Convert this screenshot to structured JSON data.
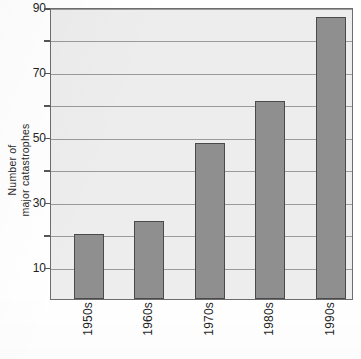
{
  "chart_data": {
    "type": "bar",
    "title": "",
    "xlabel": "",
    "ylabel_line1": "Number of",
    "ylabel_line2": "major catastrophes",
    "ylabel": "Number of major catastrophes",
    "categories": [
      "1950s",
      "1960s",
      "1970s",
      "1980s",
      "1990s"
    ],
    "values": [
      20,
      24,
      48,
      61,
      87
    ],
    "ylim": [
      0,
      90
    ],
    "ytick_labels": [
      "90",
      "70",
      "50",
      "30",
      "10"
    ],
    "ytick_values": [
      90,
      70,
      50,
      30,
      10
    ],
    "gridline_values": [
      90,
      80,
      70,
      60,
      50,
      40,
      30,
      20,
      10
    ],
    "grid": true,
    "legend": "none",
    "colors": {
      "bar_fill": "#8f8f8f",
      "bar_stroke": "#4a4a4a",
      "plot_background": "#ededed",
      "frame": "#6d6d6d",
      "gridline": "#9a9a9a",
      "text": "#1f1f1f",
      "page_background": "#ffffff"
    }
  }
}
